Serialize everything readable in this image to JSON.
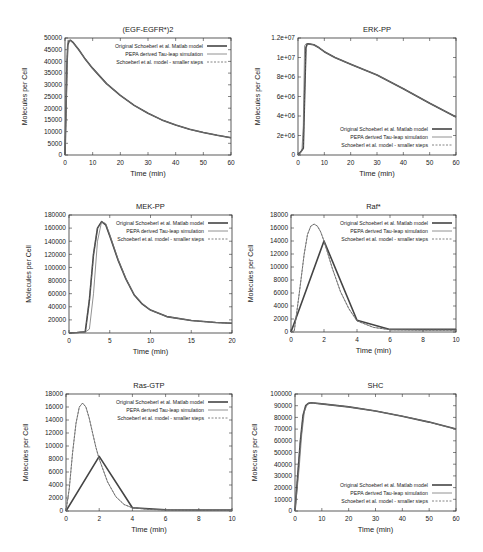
{
  "legend_entries": [
    "Original Schoeberl et al. Matlab model",
    "PEPA derived Tau-leap simulation",
    "Schoeberl et al. model - smaller steps"
  ],
  "chart_data": [
    {
      "type": "line",
      "title": "(EGF-EGFR*)2",
      "xlabel": "Time (min)",
      "ylabel": "Molecules per Cell",
      "xlim": [
        0,
        60
      ],
      "ylim": [
        0,
        50000
      ],
      "xticks": [
        0,
        10,
        20,
        30,
        40,
        50,
        60
      ],
      "yticks": [
        0,
        5000,
        10000,
        15000,
        20000,
        25000,
        30000,
        35000,
        40000,
        45000,
        50000
      ],
      "ytick_labels": [
        "0",
        "5000",
        "10000",
        "15000",
        "20000",
        "25000",
        "30000",
        "35000",
        "40000",
        "45000",
        "50000"
      ],
      "grid": false,
      "legend_position": "top-right",
      "frame": {
        "x": 65,
        "y": 38,
        "w": 166,
        "h": 117
      },
      "series": [
        {
          "name": "Original Schoeberl et al. Matlab model",
          "style": "solid-thick",
          "x": [
            0,
            0.3,
            0.7,
            1,
            1.5,
            2,
            3,
            5,
            7,
            10,
            15,
            20,
            25,
            30,
            35,
            40,
            45,
            50,
            55,
            60
          ],
          "y": [
            0,
            15000,
            38000,
            47000,
            48800,
            49000,
            48000,
            45000,
            41500,
            37000,
            30500,
            25500,
            21200,
            17800,
            15000,
            12800,
            11000,
            9600,
            8400,
            7400
          ]
        },
        {
          "name": "PEPA derived Tau-leap simulation",
          "style": "solid-thin",
          "x": [
            0,
            1,
            2,
            3,
            5,
            7,
            10,
            15,
            20,
            25,
            30,
            35,
            40,
            45,
            50,
            55,
            60
          ],
          "y": [
            0,
            49000,
            48900,
            48000,
            45000,
            41500,
            37000,
            30500,
            25500,
            21200,
            17800,
            15000,
            12800,
            11000,
            9600,
            8400,
            7400
          ]
        },
        {
          "name": "Schoeberl et al. model - smaller steps",
          "style": "dashed",
          "x": [
            0,
            0.3,
            0.7,
            1,
            1.5,
            2,
            3,
            5,
            7,
            10,
            15,
            20,
            25,
            30,
            35,
            40,
            45,
            50,
            55,
            60
          ],
          "y": [
            0,
            15000,
            38000,
            47000,
            48800,
            49000,
            48000,
            45000,
            41500,
            37000,
            30500,
            25500,
            21200,
            17800,
            15000,
            12800,
            11000,
            9600,
            8400,
            7400
          ]
        }
      ]
    },
    {
      "type": "line",
      "title": "ERK-PP",
      "xlabel": "Time (min)",
      "ylabel": "Molecules per Cell",
      "xlim": [
        0,
        60
      ],
      "ylim": [
        0,
        12000000
      ],
      "xticks": [
        0,
        10,
        20,
        30,
        40,
        50,
        60
      ],
      "yticks": [
        0,
        2000000,
        4000000,
        6000000,
        8000000,
        10000000,
        12000000
      ],
      "ytick_labels": [
        "0",
        "2e+06",
        "4e+06",
        "6e+06",
        "8e+06",
        "1e+07",
        "1.2e+07"
      ],
      "grid": false,
      "legend_position": "bottom-right",
      "frame": {
        "x": 298,
        "y": 38,
        "w": 158,
        "h": 117
      },
      "series": [
        {
          "name": "Original Schoeberl et al. Matlab model",
          "style": "solid-thick",
          "x": [
            0,
            1,
            2,
            2.5,
            3,
            3.5,
            4,
            6,
            8,
            10,
            14,
            20,
            30,
            40,
            50,
            60
          ],
          "y": [
            0,
            300000,
            700000,
            6000000,
            11000000,
            11400000,
            11400000,
            11300000,
            11000000,
            10600000,
            10000000,
            9300000,
            8200000,
            6800000,
            5300000,
            3900000
          ]
        },
        {
          "name": "PEPA derived Tau-leap simulation",
          "style": "solid-thin",
          "x": [
            0,
            1.5,
            2,
            2.5,
            3,
            4,
            6,
            8,
            10,
            14,
            20,
            30,
            40,
            50,
            60
          ],
          "y": [
            0,
            400000,
            3000000,
            11200000,
            11400000,
            11400000,
            11300000,
            11000000,
            10600000,
            10000000,
            9300000,
            8200000,
            6800000,
            5300000,
            3900000
          ]
        },
        {
          "name": "Schoeberl et al. model - smaller steps",
          "style": "dashed",
          "x": [
            0,
            1,
            2,
            2.5,
            3,
            3.5,
            4,
            6,
            8,
            10,
            14,
            20,
            30,
            40,
            50,
            60
          ],
          "y": [
            0,
            300000,
            700000,
            6000000,
            11000000,
            11400000,
            11400000,
            11300000,
            11000000,
            10600000,
            10000000,
            9300000,
            8200000,
            6800000,
            5300000,
            3900000
          ]
        }
      ]
    },
    {
      "type": "line",
      "title": "MEK-PP",
      "xlabel": "Time (min)",
      "ylabel": "Molecules per Cell",
      "xlim": [
        0,
        20
      ],
      "ylim": [
        0,
        180000
      ],
      "xticks": [
        0,
        5,
        10,
        15,
        20
      ],
      "yticks": [
        0,
        20000,
        40000,
        60000,
        80000,
        100000,
        120000,
        140000,
        160000,
        180000
      ],
      "ytick_labels": [
        "0",
        "20000",
        "40000",
        "60000",
        "80000",
        "100000",
        "120000",
        "140000",
        "160000",
        "180000"
      ],
      "grid": false,
      "legend_position": "top-right",
      "frame": {
        "x": 69,
        "y": 215,
        "w": 163,
        "h": 118
      },
      "series": [
        {
          "name": "Original Schoeberl et al. Matlab model",
          "style": "solid-thick",
          "x": [
            0,
            1,
            2,
            2.5,
            3,
            3.5,
            4,
            4.5,
            5,
            6,
            7,
            8,
            9,
            10,
            12,
            15,
            18,
            20
          ],
          "y": [
            0,
            800,
            2000,
            50000,
            120000,
            160000,
            170000,
            165000,
            148000,
            112000,
            82000,
            58000,
            44000,
            35000,
            25000,
            19000,
            16000,
            15000
          ]
        },
        {
          "name": "PEPA derived Tau-leap simulation",
          "style": "solid-thin",
          "x": [
            0,
            2,
            2.5,
            3,
            3.5,
            4,
            4.5,
            5,
            6,
            7,
            8,
            9,
            10,
            12,
            15,
            18,
            20
          ],
          "y": [
            0,
            1500,
            6000,
            60000,
            140000,
            170000,
            167000,
            150000,
            113000,
            83000,
            59000,
            45000,
            35000,
            25000,
            19000,
            16000,
            15000
          ]
        },
        {
          "name": "Schoeberl et al. model - smaller steps",
          "style": "dashed",
          "x": [
            0,
            1,
            2,
            2.5,
            3,
            3.5,
            4,
            4.5,
            5,
            6,
            7,
            8,
            9,
            10,
            12,
            15,
            18,
            20
          ],
          "y": [
            0,
            800,
            2000,
            50000,
            120000,
            160000,
            170000,
            165000,
            148000,
            112000,
            82000,
            58000,
            44000,
            35000,
            25000,
            19000,
            16000,
            15000
          ]
        }
      ]
    },
    {
      "type": "line",
      "title": "Raf*",
      "xlabel": "Time (min)",
      "ylabel": "Molecules per Cell",
      "xlim": [
        0,
        10
      ],
      "ylim": [
        0,
        18000
      ],
      "xticks": [
        0,
        2,
        4,
        6,
        8,
        10
      ],
      "yticks": [
        0,
        2000,
        4000,
        6000,
        8000,
        10000,
        12000,
        14000,
        16000,
        18000
      ],
      "ytick_labels": [
        "0",
        "2000",
        "4000",
        "6000",
        "8000",
        "10000",
        "12000",
        "14000",
        "16000",
        "18000"
      ],
      "grid": false,
      "legend_position": "top-right",
      "frame": {
        "x": 291,
        "y": 215,
        "w": 165,
        "h": 117
      },
      "series": [
        {
          "name": "Original Schoeberl et al. Matlab model",
          "style": "solid-thick",
          "x": [
            0,
            2,
            4,
            6,
            8,
            10
          ],
          "y": [
            0,
            14000,
            1800,
            400,
            400,
            400
          ]
        },
        {
          "name": "PEPA derived Tau-leap simulation",
          "style": "solid-thin",
          "x": [
            0,
            0.2,
            0.5,
            0.8,
            1,
            1.2,
            1.4,
            1.6,
            1.8,
            2,
            2.5,
            3,
            3.5,
            4,
            5,
            6,
            8,
            10
          ],
          "y": [
            0,
            200,
            6000,
            12000,
            15000,
            16300,
            16600,
            16300,
            15400,
            14000,
            9800,
            6200,
            3600,
            1700,
            700,
            350,
            300,
            300
          ]
        },
        {
          "name": "Schoeberl et al. model - smaller steps",
          "style": "dashed",
          "x": [
            0,
            0.2,
            0.5,
            0.8,
            1,
            1.2,
            1.4,
            1.6,
            1.8,
            2,
            2.5,
            3,
            3.5,
            4,
            5,
            6,
            8,
            10
          ],
          "y": [
            0,
            200,
            6000,
            12000,
            15000,
            16300,
            16600,
            16300,
            15400,
            14000,
            9800,
            6200,
            3600,
            1700,
            700,
            350,
            300,
            300
          ]
        }
      ]
    },
    {
      "type": "line",
      "title": "Ras-GTP",
      "xlabel": "Time (min)",
      "ylabel": "Molecules per Cell",
      "xlim": [
        0,
        10
      ],
      "ylim": [
        0,
        18000
      ],
      "xticks": [
        0,
        2,
        4,
        6,
        8,
        10
      ],
      "yticks": [
        0,
        2000,
        4000,
        6000,
        8000,
        10000,
        12000,
        14000,
        16000,
        18000
      ],
      "ytick_labels": [
        "0",
        "2000",
        "4000",
        "6000",
        "8000",
        "10000",
        "12000",
        "14000",
        "16000",
        "18000"
      ],
      "grid": false,
      "legend_position": "top-right",
      "frame": {
        "x": 66,
        "y": 394,
        "w": 166,
        "h": 117
      },
      "series": [
        {
          "name": "Original Schoeberl et al. Matlab model",
          "style": "solid-thick",
          "x": [
            0,
            2,
            4,
            6,
            8,
            10
          ],
          "y": [
            0,
            8400,
            500,
            200,
            150,
            150
          ]
        },
        {
          "name": "PEPA derived Tau-leap simulation",
          "style": "solid-thin",
          "x": [
            0,
            0.2,
            0.4,
            0.6,
            0.8,
            1,
            1.2,
            1.4,
            1.6,
            1.8,
            2,
            2.5,
            3,
            3.5,
            4,
            5,
            6,
            8,
            10
          ],
          "y": [
            0,
            3500,
            9000,
            13500,
            16000,
            16600,
            16000,
            14300,
            12000,
            9800,
            8000,
            4500,
            2200,
            1000,
            500,
            250,
            150,
            100,
            100
          ]
        },
        {
          "name": "Schoeberl et al. model - smaller steps",
          "style": "dashed",
          "x": [
            0,
            0.2,
            0.4,
            0.6,
            0.8,
            1,
            1.2,
            1.4,
            1.6,
            1.8,
            2,
            2.5,
            3,
            3.5,
            4,
            5,
            6,
            8,
            10
          ],
          "y": [
            0,
            3500,
            9000,
            13500,
            16000,
            16600,
            16000,
            14300,
            12000,
            9800,
            8000,
            4500,
            2200,
            1000,
            500,
            250,
            150,
            100,
            100
          ]
        }
      ]
    },
    {
      "type": "line",
      "title": "SHC",
      "xlabel": "Time (min)",
      "ylabel": "Molecules per Cell",
      "xlim": [
        0,
        60
      ],
      "ylim": [
        0,
        100000
      ],
      "xticks": [
        0,
        10,
        20,
        30,
        40,
        50,
        60
      ],
      "yticks": [
        0,
        10000,
        20000,
        30000,
        40000,
        50000,
        60000,
        70000,
        80000,
        90000,
        100000
      ],
      "ytick_labels": [
        "0",
        "10000",
        "20000",
        "30000",
        "40000",
        "50000",
        "60000",
        "70000",
        "80000",
        "90000",
        "100000"
      ],
      "grid": false,
      "legend_position": "bottom-right",
      "frame": {
        "x": 295,
        "y": 394,
        "w": 161,
        "h": 117
      },
      "series": [
        {
          "name": "Original Schoeberl et al. Matlab model",
          "style": "solid-thick",
          "x": [
            0,
            1,
            2,
            3,
            4,
            5,
            6,
            10,
            20,
            30,
            40,
            50,
            60
          ],
          "y": [
            0,
            30000,
            60000,
            82000,
            90000,
            92000,
            92500,
            91500,
            89000,
            85500,
            81000,
            76000,
            70000
          ]
        },
        {
          "name": "PEPA derived Tau-leap simulation",
          "style": "solid-thin",
          "x": [
            0,
            1.5,
            2.5,
            3.5,
            4.5,
            5.5,
            6,
            10,
            20,
            30,
            40,
            50,
            60
          ],
          "y": [
            0,
            35000,
            65000,
            85000,
            91000,
            92500,
            92500,
            91500,
            89000,
            85500,
            81000,
            76000,
            70000
          ]
        },
        {
          "name": "Schoeberl et al. model - smaller steps",
          "style": "dashed",
          "x": [
            0,
            1,
            2,
            3,
            4,
            5,
            6,
            10,
            20,
            30,
            40,
            50,
            60
          ],
          "y": [
            0,
            30000,
            60000,
            82000,
            90000,
            92000,
            92500,
            91500,
            89000,
            85500,
            81000,
            76000,
            70000
          ]
        }
      ]
    }
  ]
}
